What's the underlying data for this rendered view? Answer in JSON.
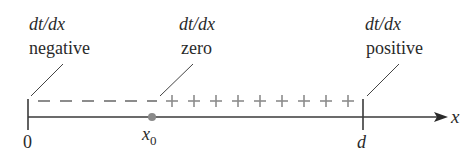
{
  "diagram": {
    "type": "number-line",
    "labels": [
      {
        "id": "negative",
        "derivative": "dt/dx",
        "sign_word": "negative"
      },
      {
        "id": "zero",
        "derivative": "dt/dx",
        "sign_word": "zero"
      },
      {
        "id": "positive",
        "derivative": "dt/dx",
        "sign_word": "positive"
      }
    ],
    "axis": {
      "variable": "x",
      "start_tick": "0",
      "point_label": "x",
      "point_subscript": "0",
      "end_tick": "d"
    },
    "sign_chart": {
      "minus_count": 6,
      "plus_count": 9,
      "minus_symbol": "–",
      "plus_symbol": "+"
    },
    "colors": {
      "axis": "#3a3a3a",
      "signs": "#8c8c8c",
      "point": "#8a8a8a",
      "text": "#2a2a2a"
    }
  }
}
